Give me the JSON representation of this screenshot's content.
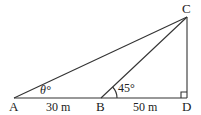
{
  "diagram": {
    "type": "right-triangle-elevation",
    "points": {
      "A": {
        "label": "A",
        "x": 14,
        "y": 98
      },
      "B": {
        "label": "B",
        "x": 101,
        "y": 98
      },
      "C": {
        "label": "C",
        "x": 187,
        "y": 17
      },
      "D": {
        "label": "D",
        "x": 187,
        "y": 98
      }
    },
    "segments": [
      {
        "from": "A",
        "to": "D"
      },
      {
        "from": "A",
        "to": "C"
      },
      {
        "from": "B",
        "to": "C"
      },
      {
        "from": "C",
        "to": "D"
      }
    ],
    "measurements": {
      "AB": "30 m",
      "BD": "50 m"
    },
    "angles": {
      "at_A": "θ°",
      "at_B": "45°",
      "at_D": "right-angle"
    },
    "colors": {
      "line": "#333333",
      "text": "#222222",
      "background": "#ffffff"
    }
  }
}
